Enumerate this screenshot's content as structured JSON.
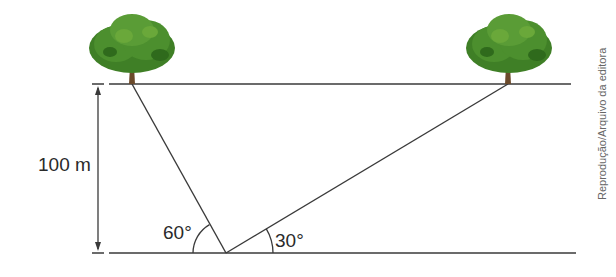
{
  "diagram": {
    "type": "geometry-trigonometry",
    "height_label": "100 m",
    "angle_left_label": "60°",
    "angle_right_label": "30°",
    "credit": "Reprodução/Arquivo da editora",
    "colors": {
      "line": "#3a3a3a",
      "tree_foliage": "#3f7f26",
      "tree_foliage_light": "#6aa83a",
      "tree_trunk": "#6b4a2b",
      "text": "#2a2a2a"
    }
  }
}
